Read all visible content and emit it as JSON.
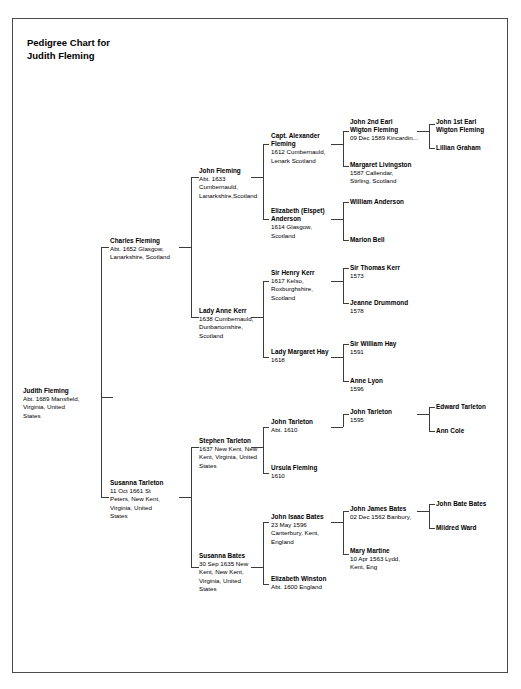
{
  "document": {
    "title": "Pedigree Chart for\nJudith Fleming",
    "title_line1": "Pedigree Chart for",
    "title_line2": "Judith Fleming",
    "border_color": "#4a4a4a",
    "line_color": "#3c3c3c",
    "text_color": "#000000",
    "background": "#ffffff"
  },
  "people": {
    "root": {
      "name": "Judith Fleming",
      "details": "Abt. 1689 Mansfield,\nVirginia, United\nStates"
    },
    "g2_father": {
      "name": "Charles Fleming",
      "details": "Abt. 1652 Glasgow,\nLanarkshire, Scotland"
    },
    "g2_mother": {
      "name": "Susanna Tarleton",
      "details": "11 Oct 1661 St\nPeters, New Kent,\nVirginia, United\nStates"
    },
    "g3_ff": {
      "name": "John Fleming",
      "details": "Abt. 1633\nCumbernauld,\nLanarkshire,Scotland"
    },
    "g3_fm": {
      "name": "Lady Anne Kerr",
      "details": "1638 Cumbernauld,\nDunbartonshire,\nScotland"
    },
    "g3_mf": {
      "name": "Stephen Tarleton",
      "details": "1637 New Kent, New\nKent, Virginia, United\nStates"
    },
    "g3_mm": {
      "name": "Susanna Bates",
      "details": "30 Sep 1635 New\nKent, New Kent,\nVirginia, United\nStates"
    },
    "g4_fff": {
      "name": "Capt. Alexander\nFleming",
      "details": "1612 Cumbernauld,\nLenark Scotland"
    },
    "g4_ffm": {
      "name": "Elizabeth (Elspet)\nAnderson",
      "details": "1614 Glasgow,\nScotland"
    },
    "g4_fmf": {
      "name": "Sir Henry Kerr",
      "details": "1617 Kelso,\nRoxburghshire,\nScotland"
    },
    "g4_fmm": {
      "name": "Lady Margaret Hay",
      "details": "1618"
    },
    "g4_mff": {
      "name": "John Tarleton",
      "details": "Abt. 1610"
    },
    "g4_mfm": {
      "name": "Ursula Fleming",
      "details": "1610"
    },
    "g4_mmf": {
      "name": "John Isaac Bates",
      "details": "23 May 1596\nCanterbury, Kent,\nEngland"
    },
    "g4_mmm": {
      "name": "Elizabeth Winston",
      "details": "Abt. 1600 England"
    },
    "g5_ffff": {
      "name": "John 2nd Earl\nWigton Fleming",
      "details": "09 Dec 1589 Kincardin..."
    },
    "g5_fffm": {
      "name": "Margaret Livingston",
      "details": "1587 Callendar,\nStirling, Scotland"
    },
    "g5_ffmf": {
      "name": "William Anderson",
      "details": ""
    },
    "g5_ffmm": {
      "name": "Marion Bell",
      "details": ""
    },
    "g5_fmff": {
      "name": "Sir Thomas Kerr",
      "details": "1573"
    },
    "g5_fmfm": {
      "name": "Jeanne Drummond",
      "details": "1578"
    },
    "g5_fmmf": {
      "name": "Sir William Hay",
      "details": "1591"
    },
    "g5_fmmm": {
      "name": "Anne Lyon",
      "details": "1596"
    },
    "g5_mfff": {
      "name": "John Tarleton",
      "details": "1595"
    },
    "g5_mmff": {
      "name": "John James Bates",
      "details": "02 Dec 1562 Banbury,"
    },
    "g5_mmfm": {
      "name": "Mary Martine",
      "details": "10 Apr 1563 Lydd,\nKent, Eng"
    },
    "g6_fffff": {
      "name": "John 1st Earl\nWigton Fleming",
      "details": ""
    },
    "g6_ffffm": {
      "name": "Lillian Graham",
      "details": ""
    },
    "g6_mffff": {
      "name": "Edward Tarleton",
      "details": ""
    },
    "g6_mfffm": {
      "name": "Ann Cole",
      "details": ""
    },
    "g6_mmfff": {
      "name": "John Bate Bates",
      "details": ""
    },
    "g6_mmffm": {
      "name": "Mildred Ward",
      "details": ""
    }
  }
}
